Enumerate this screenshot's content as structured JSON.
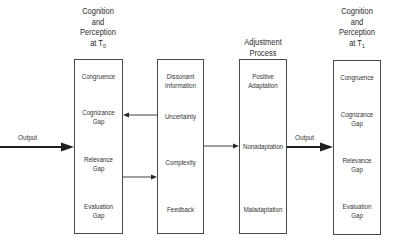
{
  "diagram": {
    "columns": [
      {
        "id": "cognition-t0",
        "heading_lines": [
          "Cognition",
          "and",
          "Perception"
        ],
        "heading_at": "at T",
        "heading_sub": "0",
        "items": [
          "Congruence",
          "Cognizance Gap",
          "Relevance Gap",
          "Evaluation Gap"
        ],
        "items_split": [
          [
            "Congruence"
          ],
          [
            "Cognizance",
            "Gap"
          ],
          [
            "Relevance",
            "Gap"
          ],
          [
            "Evaluation",
            "Gap"
          ]
        ]
      },
      {
        "id": "information",
        "heading_lines": [],
        "items": [
          "Dissonant Information",
          "Uncertainty",
          "Complexity",
          "Feedback"
        ],
        "items_split": [
          [
            "Dissonant",
            "Information"
          ],
          [
            "Uncertainty"
          ],
          [
            "Complexity"
          ],
          [
            "Feedback"
          ]
        ]
      },
      {
        "id": "adjustment-process",
        "heading_lines": [
          "Adjustment",
          "Process"
        ],
        "items": [
          "Positive Adaptation",
          "Nonadaptation",
          "Maladaptation"
        ],
        "items_split": [
          [
            "Positive",
            "Adaptation"
          ],
          [
            "Nonadaptation"
          ],
          [
            "Maladaptation"
          ]
        ]
      },
      {
        "id": "cognition-t1",
        "heading_lines": [
          "Cognition",
          "and",
          "Perception"
        ],
        "heading_at": "at T",
        "heading_sub": "1",
        "items": [
          "Congruence",
          "Cognizance Gap",
          "Relevance Gap",
          "Evaluation Gap"
        ],
        "items_split": [
          [
            "Congruence"
          ],
          [
            "Cognizance",
            "Gap"
          ],
          [
            "Relevance",
            "Gap"
          ],
          [
            "Evaluation",
            "Gap"
          ]
        ]
      }
    ],
    "edges": [
      {
        "from": "external-input",
        "to": "cognition-t0",
        "label": "Output",
        "style": "bold"
      },
      {
        "from": "information.Uncertainty",
        "to": "cognition-t0.Cognizance Gap",
        "label": "",
        "style": "thin"
      },
      {
        "from": "cognition-t0.Relevance Gap",
        "to": "information.Complexity",
        "label": "",
        "style": "thin"
      },
      {
        "from": "information",
        "to": "adjustment-process.Nonadaptation",
        "label": "",
        "style": "thin"
      },
      {
        "from": "adjustment-process.Nonadaptation",
        "to": "cognition-t1",
        "label": "Output",
        "style": "bold"
      }
    ],
    "input_arrow_label": "Output",
    "output_arrow_label": "Output",
    "line_color": "#2a2a2a"
  }
}
